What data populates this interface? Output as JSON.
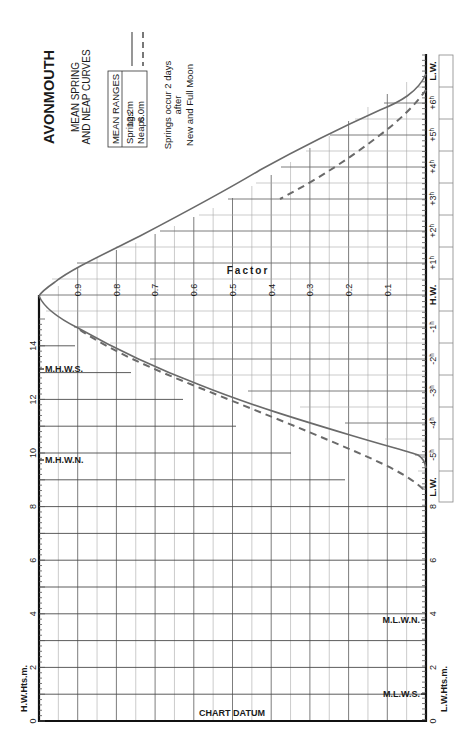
{
  "title": {
    "port": "AVONMOUTH",
    "subtitle_line1": "MEAN SPRING",
    "subtitle_line2": "AND NEAP CURVES",
    "ranges_header": "MEAN RANGES",
    "springs_label": "Springs",
    "springs_value": "12.2m",
    "neaps_label": "Neaps",
    "neaps_value": "6.0m",
    "note_line1": "Springs occur 2 days",
    "note_line2": "after",
    "note_line3": "New and Full Moon"
  },
  "axes": {
    "factor_label": "Factor",
    "hw_heights_label": "H.W.Hts.m.",
    "lw_heights_label": "L.W.Hts.m.",
    "chart_datum_label": "CHART DATUM"
  },
  "markers": {
    "mhws": "M.H.W.S.",
    "mhwn": "M.H.W.N.",
    "mlwn": "M.L.W.N.",
    "mlws": "M.L.W.S."
  },
  "colors": {
    "curve": "#6a6a6a",
    "axis": "#111111",
    "grid": "#6e6e6e"
  },
  "chart_data": {
    "type": "line",
    "orientation": "rotated 90deg counter-clockwise (time axis vertical, factor axis horizontal)",
    "xlabel": "Time relative to H.W. (hours)",
    "ylabel": "Factor",
    "factor_ticks": [
      "0.9",
      "0.8",
      "0.7",
      "0.6",
      "0.5",
      "0.4",
      "0.3",
      "0.2",
      "0.1"
    ],
    "time_ticks": [
      "L.W.",
      "-5h",
      "-4h",
      "-3h",
      "-2h",
      "-1h",
      "H.W.",
      "+1h",
      "+2h",
      "+3h",
      "+4h",
      "+5h",
      "+6h",
      "L.W."
    ],
    "hw_height_ticks": [
      "0",
      "2",
      "4",
      "6",
      "8",
      "10",
      "12",
      "14"
    ],
    "lw_height_ticks": [
      "0",
      "2",
      "4",
      "6",
      "8"
    ],
    "ylim": [
      0,
      1
    ],
    "legend": [
      {
        "name": "Springs",
        "style": "solid"
      },
      {
        "name": "Neaps",
        "style": "dashed"
      }
    ],
    "series": [
      {
        "name": "Springs",
        "x": [
          -5.4,
          -5.0,
          -4.5,
          -4.0,
          -3.5,
          -3.0,
          -2.5,
          -2.0,
          -1.5,
          -1.0,
          -0.5,
          0.0,
          0.5,
          1.0,
          1.5,
          2.0,
          2.5,
          3.0,
          3.5,
          4.0,
          4.5,
          5.0,
          5.5,
          6.0,
          6.3
        ],
        "values": [
          0.0,
          0.02,
          0.13,
          0.25,
          0.37,
          0.49,
          0.61,
          0.72,
          0.82,
          0.91,
          0.97,
          1.0,
          0.97,
          0.9,
          0.81,
          0.72,
          0.61,
          0.5,
          0.39,
          0.29,
          0.2,
          0.12,
          0.06,
          0.02,
          0.0
        ]
      },
      {
        "name": "Neaps",
        "x": [
          -6.0,
          -5.5,
          -5.0,
          -4.5,
          -4.0,
          -3.5,
          -3.0,
          -2.5,
          -2.0,
          -1.5,
          -1.0,
          -0.9,
          3.0,
          3.5,
          4.0,
          4.5,
          5.0,
          5.5,
          6.0,
          6.3
        ],
        "values": [
          0.0,
          0.06,
          0.14,
          0.24,
          0.34,
          0.44,
          0.54,
          0.65,
          0.76,
          0.85,
          0.91,
          0.92,
          0.5,
          0.42,
          0.33,
          0.25,
          0.17,
          0.1,
          0.04,
          0.0
        ]
      }
    ],
    "reference_levels_m": {
      "MHWS": 13.1,
      "MHWN": 9.7,
      "MLWN": 3.9,
      "MLWS": 1.0
    },
    "grid": true
  }
}
